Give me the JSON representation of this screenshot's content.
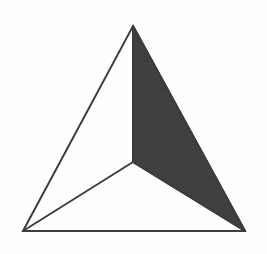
{
  "figure": {
    "type": "line-diagram",
    "canvas": {
      "width": 267,
      "height": 254
    },
    "background_color": "#fefefe",
    "stroke_color": "#3a3a3a",
    "stroke_width": 2,
    "fill_color": "#3d3d3d",
    "vertices": {
      "apex": {
        "label": "apex",
        "x": 133,
        "y": 26
      },
      "bottom_left": {
        "label": "bottom-left",
        "x": 23,
        "y": 231
      },
      "bottom_right": {
        "label": "bottom-right",
        "x": 245,
        "y": 231
      },
      "center": {
        "label": "interior-center",
        "x": 133,
        "y": 162
      }
    },
    "outer_triangle": {
      "name": "outer-triangle",
      "points": "133,26 245,231 23,231"
    },
    "shaded_region": {
      "name": "shaded-right-face",
      "points": "133,26 245,231 133,162",
      "fill": "#3d3d3d"
    },
    "internal_edges": [
      {
        "name": "edge-apex-to-center",
        "x1": 133,
        "y1": 26,
        "x2": 133,
        "y2": 162
      },
      {
        "name": "edge-center-to-bottom-left",
        "x1": 133,
        "y1": 162,
        "x2": 23,
        "y2": 231
      },
      {
        "name": "edge-center-to-bottom-right",
        "x1": 133,
        "y1": 162,
        "x2": 245,
        "y2": 231
      }
    ],
    "outer_edges": [
      {
        "name": "edge-apex-to-bottom-left",
        "x1": 133,
        "y1": 26,
        "x2": 23,
        "y2": 231
      },
      {
        "name": "edge-apex-to-bottom-right",
        "x1": 133,
        "y1": 26,
        "x2": 245,
        "y2": 231
      },
      {
        "name": "edge-bottom-left-to-bottom-right",
        "x1": 23,
        "y1": 231,
        "x2": 245,
        "y2": 231
      }
    ]
  }
}
